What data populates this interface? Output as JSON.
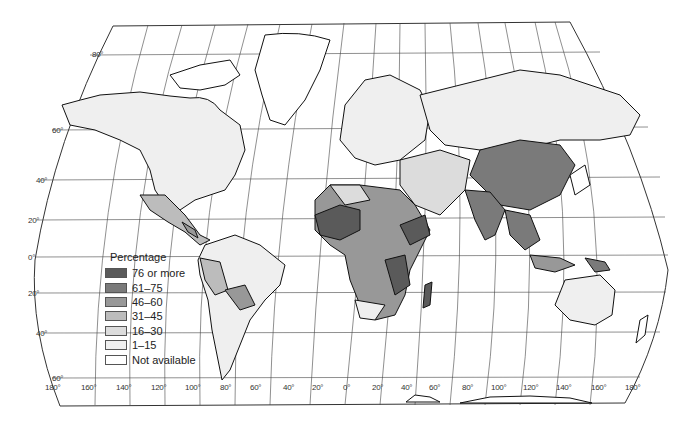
{
  "map": {
    "type": "choropleth world map",
    "projection": "pseudo-cylindrical (curved meridians)",
    "legend": {
      "title": "Percentage",
      "items": [
        {
          "label": "76 or more",
          "color": "#5a5a5a"
        },
        {
          "label": "61–75",
          "color": "#7a7a7a"
        },
        {
          "label": "46–60",
          "color": "#989898"
        },
        {
          "label": "31–45",
          "color": "#bcbcbc"
        },
        {
          "label": "16–30",
          "color": "#dcdcdc"
        },
        {
          "label": "1–15",
          "color": "#efefef"
        },
        {
          "label": "Not available",
          "color": "#ffffff"
        }
      ]
    },
    "latitude_labels": [
      "80°",
      "60°",
      "40°",
      "20°",
      "0°",
      "20°",
      "40°",
      "60°"
    ],
    "longitude_labels": [
      "180°",
      "160°",
      "140°",
      "120°",
      "100°",
      "80°",
      "60°",
      "40°",
      "20°",
      "0°",
      "20°",
      "40°",
      "60°",
      "80°",
      "100°",
      "120°",
      "140°",
      "160°",
      "180°"
    ]
  }
}
